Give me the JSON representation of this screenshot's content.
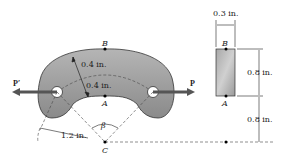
{
  "figure": {
    "type": "engineering-diagram"
  },
  "labels": {
    "point_B": "B",
    "point_A": "A",
    "point_C": "C",
    "force_left": "P′",
    "force_right": "P",
    "angle": "β",
    "dim_outer_thickness": "0.4 in.",
    "dim_inner_thickness": "0.4 in.",
    "dim_radius": "1.2 in.",
    "section_point_B": "B",
    "section_point_A": "A",
    "section_width": "0.3 in.",
    "section_height": "0.8 in.",
    "section_offset": "0.8 in."
  },
  "colors": {
    "body_fill": "#9a9a9a",
    "body_stroke": "#333333",
    "arrow": "#555555",
    "dash": "#444444"
  }
}
